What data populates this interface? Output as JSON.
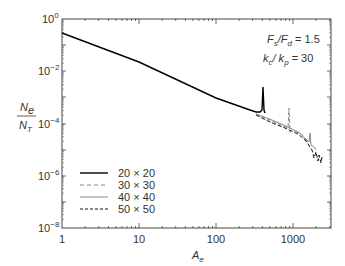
{
  "chart_data": {
    "type": "line",
    "title": "",
    "xlabel": "A_e",
    "ylabel": "N_e / N_T",
    "xscale": "log",
    "yscale": "log",
    "xlim": [
      1,
      3000
    ],
    "ylim": [
      1e-08,
      1
    ],
    "x_ticks": [
      "1",
      "10",
      "100",
      "1000"
    ],
    "y_ticks": [
      "10^0",
      "10^-2",
      "10^-4",
      "10^-6",
      "10^-8"
    ],
    "grid": false,
    "legend_position": "lower left",
    "annotations": [
      "F_s/F_d = 1.5",
      "k_c/k_p = 30"
    ],
    "series": [
      {
        "name": "20×20",
        "style": "solid black",
        "x": [
          1,
          10,
          100,
          330,
          370,
          390,
          400,
          405
        ],
        "y": [
          0.29,
          0.016,
          0.00087,
          0.00017,
          0.00015,
          0.00016,
          0.0024,
          0.00018
        ]
      },
      {
        "name": "30×30",
        "style": "dashed gray",
        "x": [
          1,
          10,
          100,
          500,
          850,
          900,
          920,
          1000,
          1500,
          2000
        ],
        "y": [
          0.29,
          0.016,
          0.00087,
          0.000114,
          6e-05,
          0.0004,
          3e-05,
          4.5e-05,
          1.5e-05,
          4e-06
        ]
      },
      {
        "name": "40×40",
        "style": "solid gray",
        "x": [
          1,
          10,
          100,
          500,
          1000,
          1600,
          1700,
          1750,
          2000
        ],
        "y": [
          0.29,
          0.016,
          0.00087,
          0.00012,
          4e-05,
          1.2e-05,
          7e-05,
          9e-06,
          5e-06
        ]
      },
      {
        "name": "50×50",
        "style": "dashed black",
        "x": [
          1,
          10,
          100,
          500,
          1000,
          1800,
          2000,
          2200,
          2400,
          2600
        ],
        "y": [
          0.29,
          0.016,
          0.00087,
          0.00011,
          4e-05,
          1.2e-05,
          4e-06,
          8e-06,
          2e-06,
          3e-06
        ]
      }
    ]
  },
  "labels": {
    "x_axis": "A",
    "x_axis_sub": "e",
    "y_num": "N",
    "y_num_sub": "e",
    "y_den": "N",
    "y_den_sub": "T",
    "ann1_a": "F",
    "ann1_a_sub": "s",
    "ann1_b": "/F",
    "ann1_b_sub": "d",
    "ann1_val": " = 1.5",
    "ann2_a": "k",
    "ann2_a_sub": "c",
    "ann2_b": "/ k",
    "ann2_b_sub": "p",
    "ann2_val": " = 30",
    "xticks": [
      "1",
      "10",
      "100",
      "1000"
    ],
    "yticks_base": "10",
    "yticks_exp": [
      "0",
      "−2",
      "−4",
      "−6",
      "−8"
    ],
    "legend": [
      "20 × 20",
      "30 × 30",
      "40 × 40",
      "50 × 50"
    ]
  }
}
